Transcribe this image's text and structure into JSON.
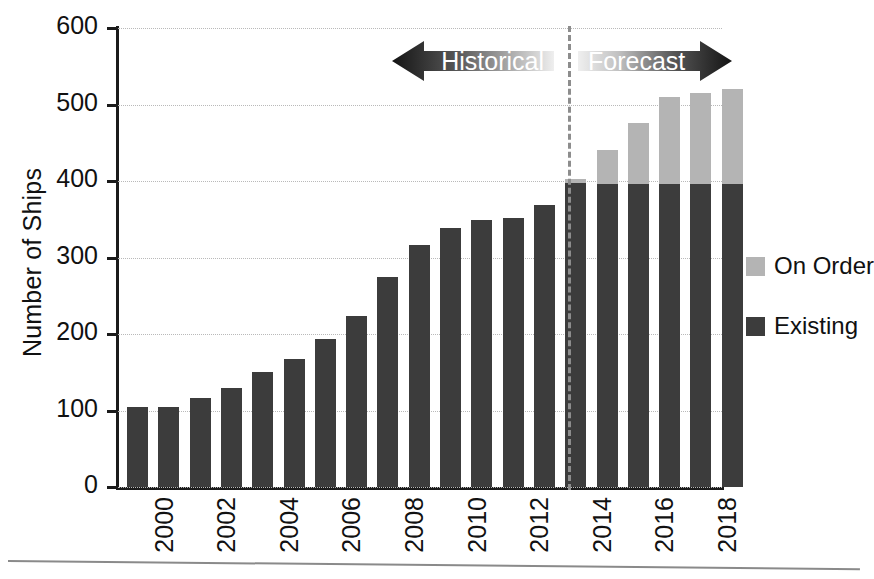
{
  "chart_data": {
    "type": "bar",
    "title": "",
    "subtitle": "",
    "xlabel": "",
    "ylabel": "Number of Ships",
    "ylim": [
      0,
      600
    ],
    "ytick_values": [
      0,
      100,
      200,
      300,
      400,
      500,
      600
    ],
    "ytick_labels": [
      "0",
      "100",
      "200",
      "300",
      "400",
      "500",
      "600"
    ],
    "grid": "horizontal-dotted",
    "legend_position": "right",
    "stacked": true,
    "x": [
      2000,
      2001,
      2002,
      2003,
      2004,
      2005,
      2006,
      2007,
      2008,
      2009,
      2010,
      2011,
      2012,
      2013,
      2014,
      2015,
      2016,
      2017,
      2018,
      2019
    ],
    "xtick_labels": [
      "2000",
      "2002",
      "2004",
      "2006",
      "2008",
      "2010",
      "2012",
      "2014",
      "2016",
      "2018"
    ],
    "xtick_years": [
      2000,
      2002,
      2004,
      2006,
      2008,
      2010,
      2012,
      2014,
      2016,
      2018
    ],
    "series": [
      {
        "name": "Existing",
        "color": "#3c3c3c",
        "values": [
          105,
          105,
          116,
          129,
          150,
          167,
          194,
          224,
          274,
          317,
          339,
          349,
          352,
          368,
          398,
          396,
          396,
          396,
          396,
          396
        ]
      },
      {
        "name": "On Order",
        "color": "#b4b4b4",
        "values": [
          0,
          0,
          0,
          0,
          0,
          0,
          0,
          0,
          0,
          0,
          0,
          0,
          0,
          0,
          4,
          44,
          80,
          114,
          119,
          124
        ]
      }
    ],
    "totals": [
      105,
      105,
      116,
      129,
      150,
      167,
      194,
      224,
      274,
      317,
      339,
      349,
      352,
      368,
      402,
      440,
      476,
      510,
      515,
      520
    ],
    "annotations": [
      {
        "name": "historical-arrow",
        "label": "Historical",
        "direction": "left",
        "span_years": [
          2000,
          2014
        ]
      },
      {
        "name": "forecast-arrow",
        "label": "Forecast",
        "direction": "right",
        "span_years": [
          2015,
          2019
        ]
      },
      {
        "name": "forecast-divider",
        "label": "",
        "type": "dashed-vertical-line",
        "at_year": 2014.5
      }
    ]
  },
  "legend": {
    "items": [
      {
        "label": "On Order",
        "color": "#b4b4b4"
      },
      {
        "label": "Existing",
        "color": "#3c3c3c"
      }
    ]
  },
  "arrows": {
    "historical_label": "Historical",
    "forecast_label": "Forecast"
  },
  "axes": {
    "y_title": "Number of Ships"
  },
  "colors": {
    "existing": "#3c3c3c",
    "on_order": "#b4b4b4",
    "axis": "#1b1b1b",
    "grid": "#b9b9b9",
    "divider": "#8d8d8d",
    "arrow_dark": "#1b1b1b",
    "arrow_light": "#e2e2e2"
  }
}
